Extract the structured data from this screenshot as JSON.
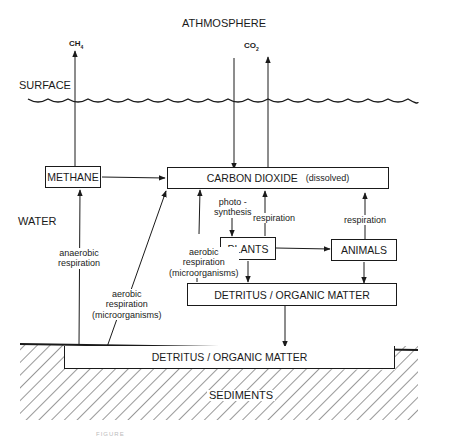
{
  "diagram": {
    "regions": {
      "atmosphere": "ATHMOSPHERE",
      "surface": "SURFACE",
      "water": "WATER",
      "sediments": "SEDIMENTS"
    },
    "gases": {
      "methane_gas": "CH",
      "methane_sub": "4",
      "co2_gas": "CO",
      "co2_sub": "2"
    },
    "nodes": {
      "methane": "METHANE",
      "carbon_dioxide": "CARBON DIOXIDE",
      "carbon_dioxide_note": "(dissolved)",
      "plants": "PLANTS",
      "animals": "ANIMALS",
      "detritus_water": "DETRITUS / ORGANIC MATTER",
      "detritus_sediment": "DETRITUS / ORGANIC MATTER"
    },
    "edge_labels": {
      "anaerobic_1": "anaerobic",
      "anaerobic_2": "respiration",
      "aerobic_sed_1": "aerobic",
      "aerobic_sed_2": "respiration",
      "aerobic_sed_3": "(microorganisms)",
      "aerobic_det_1": "aerobic",
      "aerobic_det_2": "respiration",
      "aerobic_det_3": "(microorganisms)",
      "photo_1": "photo -",
      "photo_2": "synthesis",
      "plant_resp": "respiration",
      "animal_resp": "respiration"
    },
    "edges": [
      {
        "from": "METHANE",
        "to": "CH4 (atmosphere)"
      },
      {
        "from": "METHANE",
        "to": "CARBON DIOXIDE"
      },
      {
        "from": "CO2 (atmosphere)",
        "to": "CARBON DIOXIDE"
      },
      {
        "from": "CARBON DIOXIDE",
        "to": "CO2 (atmosphere)"
      },
      {
        "from": "CARBON DIOXIDE",
        "to": "PLANTS",
        "label": "photo - synthesis"
      },
      {
        "from": "PLANTS",
        "to": "CARBON DIOXIDE",
        "label": "respiration"
      },
      {
        "from": "ANIMALS",
        "to": "CARBON DIOXIDE",
        "label": "respiration"
      },
      {
        "from": "PLANTS",
        "to": "ANIMALS"
      },
      {
        "from": "PLANTS",
        "to": "DETRITUS / ORGANIC MATTER (water)"
      },
      {
        "from": "ANIMALS",
        "to": "DETRITUS / ORGANIC MATTER (water)"
      },
      {
        "from": "DETRITUS / ORGANIC MATTER (water)",
        "to": "CARBON DIOXIDE",
        "label": "aerobic respiration (microorganisms)"
      },
      {
        "from": "DETRITUS / ORGANIC MATTER (water)",
        "to": "DETRITUS / ORGANIC MATTER (sediment)"
      },
      {
        "from": "DETRITUS / ORGANIC MATTER (sediment)",
        "to": "METHANE",
        "label": "anaerobic respiration"
      },
      {
        "from": "DETRITUS / ORGANIC MATTER (sediment)",
        "to": "CARBON DIOXIDE",
        "label": "aerobic respiration (microorganisms)"
      }
    ],
    "caption": "FIGURE"
  }
}
